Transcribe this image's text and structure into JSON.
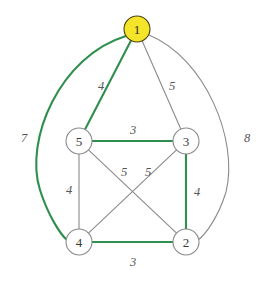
{
  "figure": {
    "background_color": "#ffffff",
    "width": 273,
    "height": 281
  },
  "style": {
    "edge_green": "#2f8f4e",
    "edge_gray": "#8a8a8a",
    "node_fill_default": "#ffffff",
    "node_stroke_default": "#8a8a8a",
    "node_fill_highlight": "#f5e52a",
    "node_stroke_highlight": "#4a4010",
    "label_color": "#555555",
    "node_text_color": "#3a3a3a"
  },
  "chart_data": {
    "type": "diagram",
    "nodes": [
      {
        "id": "1",
        "label": "1",
        "x": 137,
        "y": 29,
        "r": 13,
        "highlighted": true
      },
      {
        "id": "5",
        "label": "5",
        "x": 79,
        "y": 141,
        "r": 13,
        "highlighted": false
      },
      {
        "id": "3",
        "label": "3",
        "x": 186,
        "y": 141,
        "r": 13,
        "highlighted": false
      },
      {
        "id": "4",
        "label": "4",
        "x": 79,
        "y": 242,
        "r": 13,
        "highlighted": false
      },
      {
        "id": "2",
        "label": "2",
        "x": 186,
        "y": 242,
        "r": 13,
        "highlighted": false
      }
    ],
    "edges": [
      {
        "id": "e-1-5",
        "from": "1",
        "to": "5",
        "weight": "4",
        "color": "#2f8f4e",
        "width": 2.1,
        "curved": false,
        "label_x": 101,
        "label_y": 86
      },
      {
        "id": "e-1-3",
        "from": "1",
        "to": "3",
        "weight": "5",
        "color": "#8a8a8a",
        "width": 1.1,
        "curved": false,
        "label_x": 172,
        "label_y": 86
      },
      {
        "id": "e-1-4",
        "from": "1",
        "to": "4",
        "weight": "7",
        "color": "#2f8f4e",
        "width": 2.1,
        "curved": true,
        "path": "M 126 36 C 60 56, 24 140, 40 190 C 48 215, 60 234, 67 240",
        "label_x": 24,
        "label_y": 138
      },
      {
        "id": "e-1-2",
        "from": "1",
        "to": "2",
        "weight": "8",
        "color": "#8a8a8a",
        "width": 1.1,
        "curved": true,
        "path": "M 149 35 C 205 58, 239 140, 226 192 C 218 218, 205 235, 198 240",
        "label_x": 247,
        "label_y": 138
      },
      {
        "id": "e-5-3",
        "from": "5",
        "to": "3",
        "weight": "3",
        "color": "#2f8f4e",
        "width": 2.1,
        "curved": false,
        "label_x": 133,
        "label_y": 130
      },
      {
        "id": "e-5-4",
        "from": "5",
        "to": "4",
        "weight": "4",
        "color": "#8a8a8a",
        "width": 1.1,
        "curved": false,
        "label_x": 69,
        "label_y": 190
      },
      {
        "id": "e-5-2",
        "from": "5",
        "to": "2",
        "weight": "5",
        "color": "#8a8a8a",
        "width": 1.1,
        "curved": false,
        "label_x": 124,
        "label_y": 172
      },
      {
        "id": "e-3-4",
        "from": "3",
        "to": "4",
        "weight": "5",
        "color": "#8a8a8a",
        "width": 1.1,
        "curved": false,
        "label_x": 148,
        "label_y": 172
      },
      {
        "id": "e-3-2",
        "from": "3",
        "to": "2",
        "weight": "4",
        "color": "#2f8f4e",
        "width": 2.1,
        "curved": false,
        "label_x": 197,
        "label_y": 192
      },
      {
        "id": "e-4-2",
        "from": "4",
        "to": "2",
        "weight": "3",
        "color": "#2f8f4e",
        "width": 2.1,
        "curved": false,
        "label_x": 133,
        "label_y": 262
      }
    ]
  }
}
